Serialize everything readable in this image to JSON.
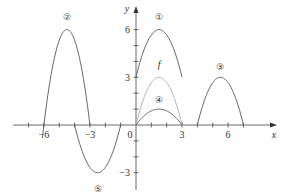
{
  "chart_data": {
    "type": "line",
    "title": "",
    "xlabel": "x",
    "ylabel": "y",
    "xlim": [
      -7.5,
      8.5
    ],
    "ylim": [
      -4,
      7
    ],
    "grid": false,
    "x_ticks": [
      -7,
      -6,
      -5,
      -4,
      -3,
      -2,
      -1,
      1,
      2,
      3,
      4,
      5,
      6,
      7
    ],
    "x_tick_labels": [
      {
        "value": -6,
        "label": "−6"
      },
      {
        "value": -3,
        "label": "−3"
      },
      {
        "value": 0,
        "label": "0"
      },
      {
        "value": 3,
        "label": "3"
      },
      {
        "value": 6,
        "label": "6"
      }
    ],
    "y_ticks": [
      -3,
      -2,
      -1,
      1,
      2,
      3,
      4,
      5,
      6
    ],
    "y_tick_labels": [
      {
        "value": 6,
        "label": "6"
      },
      {
        "value": 3,
        "label": "3"
      },
      {
        "value": -3,
        "label": "−3"
      }
    ],
    "series": [
      {
        "name": "f",
        "label": "f",
        "color": "#b5b5b5",
        "formula": "f(x) = -4/3 x (x - 3)",
        "domain": [
          0,
          3
        ],
        "vertex": [
          1.5,
          3
        ],
        "label_pos": [
          1.5,
          3.8
        ]
      },
      {
        "name": "curve-1",
        "label": "①",
        "color": "#666666",
        "formula": "f(x) + 3",
        "domain": [
          0,
          3
        ],
        "vertex": [
          1.5,
          6
        ],
        "label_pos": [
          1.5,
          6.8
        ]
      },
      {
        "name": "curve-2",
        "label": "②",
        "color": "#666666",
        "formula": "2 f(x + 6)",
        "domain": [
          -6.1,
          -3
        ],
        "vertex": [
          -4.5,
          6
        ],
        "label_pos": [
          -4.5,
          6.8
        ]
      },
      {
        "name": "curve-3",
        "label": "③",
        "color": "#666666",
        "formula": "f(x - 4)",
        "domain": [
          4,
          7
        ],
        "vertex": [
          5.5,
          3
        ],
        "label_pos": [
          5.5,
          3.7
        ]
      },
      {
        "name": "curve-4",
        "label": "④",
        "color": "#666666",
        "formula": "f(x) / 3",
        "domain": [
          0,
          3
        ],
        "vertex": [
          1.5,
          1
        ],
        "label_pos": [
          1.5,
          1.6
        ]
      },
      {
        "name": "curve-5",
        "label": "⑤",
        "color": "#666666",
        "formula": "-f(x + 4)",
        "domain": [
          -4,
          -1
        ],
        "vertex": [
          -2.5,
          -3
        ],
        "label_pos": [
          -2.5,
          -4.0
        ]
      }
    ]
  },
  "axes": {
    "x_label": "x",
    "y_label": "y",
    "origin_label": "0"
  }
}
